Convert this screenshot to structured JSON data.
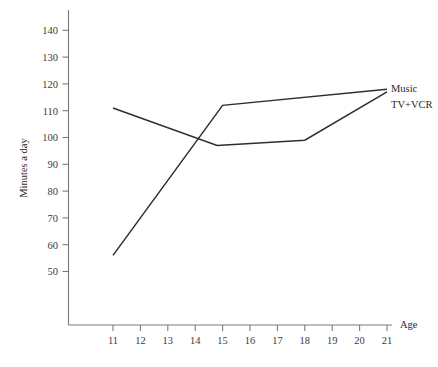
{
  "chart_data": {
    "type": "line",
    "title": "",
    "xlabel": "Age",
    "ylabel": "Minutes a day",
    "xlim": [
      10.2,
      21.6
    ],
    "ylim": [
      44,
      145
    ],
    "grid": false,
    "legend_position": "right-of-line-ends",
    "x_ticks": [
      11,
      12,
      13,
      14,
      15,
      16,
      17,
      18,
      19,
      20,
      21
    ],
    "x_tick_labels": [
      "11",
      "12",
      "13",
      "14",
      "15",
      "16",
      "17",
      "18",
      "19",
      "20",
      "21"
    ],
    "y_ticks": [
      50,
      60,
      70,
      80,
      90,
      100,
      110,
      120,
      130,
      140
    ],
    "y_tick_labels": [
      "50",
      "60",
      "70",
      "80",
      "90",
      "100",
      "110",
      "120",
      "130",
      "140"
    ],
    "line_color": "#2e2e2e",
    "axis_color": "#7a7a7a",
    "series": [
      {
        "name": "Music",
        "label": "Music",
        "x": [
          11,
          15,
          21
        ],
        "values": [
          56,
          112,
          118
        ]
      },
      {
        "name": "TV+VCR",
        "label": "TV+VCR",
        "x": [
          11,
          14.8,
          18,
          21
        ],
        "values": [
          111,
          97,
          99,
          117
        ]
      }
    ],
    "annotations": [
      {
        "text": "Music",
        "series": "Music",
        "at_x": 21,
        "at_y": 118
      },
      {
        "text": "TV+VCR",
        "series": "TV+VCR",
        "at_x": 21,
        "at_y": 117
      }
    ]
  },
  "axes": {
    "x_title": "Age",
    "y_title": "Minutes a day"
  },
  "legend": {
    "music": "Music",
    "tvvcr": "TV+VCR"
  }
}
